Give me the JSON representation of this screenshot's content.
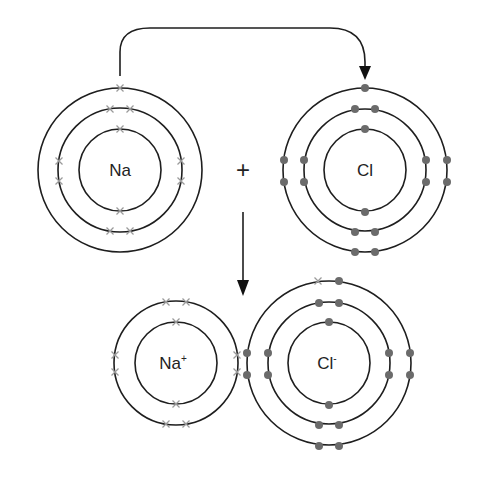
{
  "diagram": {
    "operator": "+",
    "atoms": {
      "na": {
        "label": "Na",
        "charge": "",
        "electron_marker": "cross",
        "shells": [
          2,
          8,
          1
        ]
      },
      "cl": {
        "label": "Cl",
        "charge": "",
        "electron_marker": "dot",
        "shells": [
          2,
          8,
          7
        ]
      },
      "na_ion": {
        "label": "Na",
        "charge": "+",
        "electron_marker": "cross",
        "shells": [
          2,
          8
        ]
      },
      "cl_ion": {
        "label": "Cl",
        "charge": "-",
        "electron_marker": "dot+cross",
        "shells": [
          2,
          8,
          8
        ]
      }
    },
    "arrows": [
      {
        "name": "electron-transfer-arrow",
        "from": "Na outer electron",
        "to": "Cl outer shell"
      },
      {
        "name": "reaction-arrow",
        "from": "reactants",
        "to": "products"
      }
    ],
    "colors": {
      "shell": "#1e1e1e",
      "dot_electron": "#6b6b6b",
      "cross_electron": "#9a9a9a",
      "background": "#ffffff"
    }
  }
}
